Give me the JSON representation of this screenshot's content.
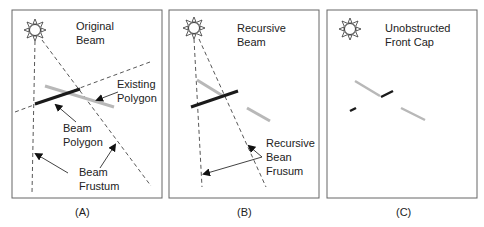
{
  "panels": [
    {
      "id": "A",
      "caption": "(A)",
      "title_lines": [
        "Original",
        "Beam"
      ],
      "labels": {
        "existing_polygon": [
          "Existing",
          "Polygon"
        ],
        "beam_polygon": [
          "Beam",
          "Polygon"
        ],
        "beam_frustum": [
          "Beam",
          "Frustum"
        ]
      }
    },
    {
      "id": "B",
      "caption": "(B)",
      "title_lines": [
        "Recursive",
        "Beam"
      ],
      "labels": {
        "recursive_frustum": [
          "Recursive",
          "Bean",
          "Frusum"
        ]
      }
    },
    {
      "id": "C",
      "caption": "(C)",
      "title_lines": [
        "Unobstructed",
        "Front Cap"
      ]
    }
  ],
  "colors": {
    "frame": "#666666",
    "dark_polygon": "#1a1a1a",
    "light_polygon": "#b8b8b8",
    "dash": "#444444"
  },
  "icons": [
    "sun-icon"
  ]
}
